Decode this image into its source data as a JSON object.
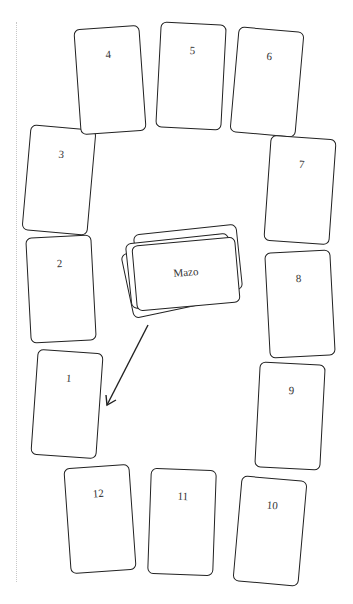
{
  "diagram": {
    "deck": {
      "label": "Mazo"
    },
    "cards": [
      {
        "label": "1",
        "cx": 67,
        "cy": 404,
        "rot": 4
      },
      {
        "label": "2",
        "cx": 61,
        "cy": 289,
        "rot": -3
      },
      {
        "label": "3",
        "cx": 59,
        "cy": 180,
        "rot": 5
      },
      {
        "label": "4",
        "cx": 110,
        "cy": 80,
        "rot": -4
      },
      {
        "label": "5",
        "cx": 191,
        "cy": 76,
        "rot": 3
      },
      {
        "label": "6",
        "cx": 267,
        "cy": 82,
        "rot": 5
      },
      {
        "label": "7",
        "cx": 300,
        "cy": 190,
        "rot": 4
      },
      {
        "label": "8",
        "cx": 300,
        "cy": 304,
        "rot": -3
      },
      {
        "label": "9",
        "cx": 290,
        "cy": 416,
        "rot": 3
      },
      {
        "label": "10",
        "cx": 270,
        "cy": 531,
        "rot": 5
      },
      {
        "label": "11",
        "cx": 182,
        "cy": 522,
        "rot": 2
      },
      {
        "label": "12",
        "cx": 100,
        "cy": 519,
        "rot": -4
      }
    ],
    "arrow": {
      "from": [
        148,
        325
      ],
      "to": [
        107,
        405
      ]
    },
    "stroke_color": "#222222"
  }
}
